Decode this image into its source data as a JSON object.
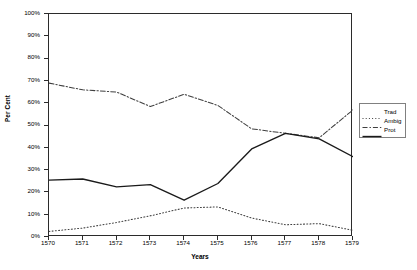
{
  "chart_data": {
    "type": "line",
    "title": "",
    "xlabel": "Years",
    "ylabel": "Per Cent",
    "x": [
      "1570",
      "1571",
      "1572",
      "1573",
      "1574",
      "1575",
      "1576",
      "1577",
      "1578",
      "1579"
    ],
    "categories": [
      "1570",
      "1571",
      "1572",
      "1573",
      "1574",
      "1575",
      "1576",
      "1577",
      "1578",
      "1579"
    ],
    "ylim": [
      0,
      100
    ],
    "ytick_labels": [
      "0%",
      "10%",
      "20%",
      "30%",
      "40%",
      "50%",
      "60%",
      "70%",
      "80%",
      "90%",
      "100%"
    ],
    "ytick_values": [
      0,
      10,
      20,
      30,
      40,
      50,
      60,
      70,
      80,
      90,
      100
    ],
    "grid": false,
    "legend_position": "right",
    "series": [
      {
        "name": "Trad",
        "style": "dotted",
        "color": "#3f3f3f",
        "values": [
          2.5,
          4.0,
          6.5,
          9.5,
          13.0,
          13.5,
          8.5,
          5.5,
          6.0,
          3.0
        ]
      },
      {
        "name": "Ambig",
        "style": "dash-dot",
        "color": "#3f3f3f",
        "values": [
          69.0,
          66.0,
          65.0,
          58.5,
          64.0,
          59.0,
          48.5,
          46.5,
          44.5,
          57.0
        ]
      },
      {
        "name": "Prot",
        "style": "solid",
        "color": "#1a1a1a",
        "values": [
          25.5,
          26.0,
          22.5,
          23.5,
          16.5,
          24.0,
          39.5,
          46.5,
          44.0,
          36.0
        ]
      }
    ]
  },
  "legend": {
    "entries": [
      {
        "label": "Trad"
      },
      {
        "label": "Ambig"
      },
      {
        "label": "Prot"
      }
    ]
  },
  "axes": {
    "y_title": "Per Cent",
    "x_title": "Years"
  }
}
